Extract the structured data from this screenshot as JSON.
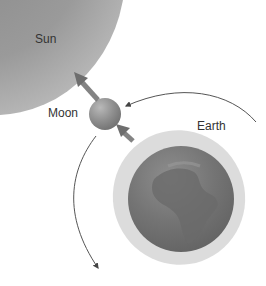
{
  "labels": {
    "sun": "Sun",
    "moon": "Moon",
    "earth": "Earth"
  },
  "colors": {
    "background": "#ffffff",
    "sun": "#9a9a9a",
    "moon": "#8e8e8e",
    "earth": "#747474",
    "earth_glow": "#dcdcdc",
    "orbit_line": "#555555",
    "force_arrow": "#6e6e6e"
  },
  "elements": {
    "force_arrows": [
      {
        "from": "moon",
        "toward": "sun"
      },
      {
        "from": "moon",
        "toward": "earth"
      }
    ],
    "orbit_arcs": [
      {
        "name": "moon-orbit-upper",
        "direction": "counterclockwise-toward-moon"
      },
      {
        "name": "moon-orbit-lower",
        "direction": "downward"
      }
    ]
  }
}
